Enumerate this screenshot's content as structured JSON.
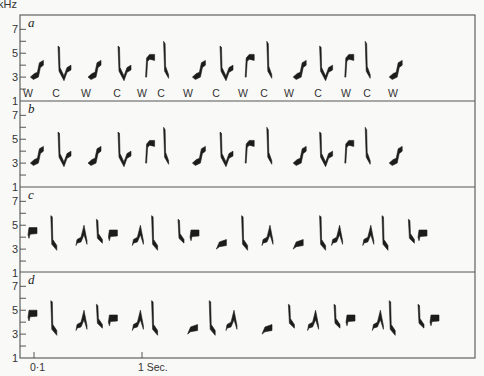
{
  "chart_data": {
    "type": "spectrogram",
    "title": "",
    "ylabel": "kHz",
    "xlabel": "",
    "y_ticks": [
      "1",
      "3",
      "5",
      "7"
    ],
    "ylim": [
      1,
      8
    ],
    "x_ticks": [
      {
        "label": "0·1",
        "t": 0.1
      },
      {
        "label": "1 Sec.",
        "t": 1.0
      }
    ],
    "xlim": [
      0,
      3.6
    ],
    "panels": [
      {
        "letter": "a",
        "note_labels": [
          "W",
          "C",
          "W",
          "C",
          "W",
          "C",
          "W",
          "C",
          "W",
          "C",
          "W",
          "C",
          "W",
          "C",
          "W"
        ],
        "syllables": [
          {
            "type": "W",
            "t": 0.07
          },
          {
            "type": "C",
            "t": 0.3
          },
          {
            "type": "W",
            "t": 0.55
          },
          {
            "type": "C",
            "t": 0.8
          },
          {
            "type": "Wf",
            "t": 1.03
          },
          {
            "type": "Cf",
            "t": 1.18
          },
          {
            "type": "W",
            "t": 1.42
          },
          {
            "type": "C",
            "t": 1.65
          },
          {
            "type": "Wf",
            "t": 1.86
          },
          {
            "type": "Cf",
            "t": 2.04
          },
          {
            "type": "W",
            "t": 2.26
          },
          {
            "type": "C",
            "t": 2.48
          },
          {
            "type": "Wf",
            "t": 2.69
          },
          {
            "type": "Cf",
            "t": 2.86
          },
          {
            "type": "W",
            "t": 3.06
          }
        ]
      },
      {
        "letter": "b",
        "note_labels": [],
        "syllables": [
          {
            "type": "W",
            "t": 0.07
          },
          {
            "type": "C",
            "t": 0.3
          },
          {
            "type": "W",
            "t": 0.55
          },
          {
            "type": "C",
            "t": 0.8
          },
          {
            "type": "Wf",
            "t": 1.03
          },
          {
            "type": "Cf",
            "t": 1.18
          },
          {
            "type": "W",
            "t": 1.42
          },
          {
            "type": "C",
            "t": 1.65
          },
          {
            "type": "Wf",
            "t": 1.86
          },
          {
            "type": "Cf",
            "t": 2.04
          },
          {
            "type": "W",
            "t": 2.26
          },
          {
            "type": "C",
            "t": 2.48
          },
          {
            "type": "Wf",
            "t": 2.69
          },
          {
            "type": "Cf",
            "t": 2.86
          },
          {
            "type": "W",
            "t": 3.06
          }
        ]
      },
      {
        "letter": "c",
        "note_labels": [],
        "syllables": [
          {
            "type": "Flat",
            "t": 0.05,
            "f": 4.5
          },
          {
            "type": "Drop",
            "t": 0.24
          },
          {
            "type": "Peak",
            "t": 0.45
          },
          {
            "type": "DropS",
            "t": 0.62
          },
          {
            "type": "Flat",
            "t": 0.72,
            "f": 4.3
          },
          {
            "type": "Peak",
            "t": 0.92
          },
          {
            "type": "Drop",
            "t": 1.08
          },
          {
            "type": "DropS",
            "t": 1.3
          },
          {
            "type": "Flat",
            "t": 1.4,
            "f": 4.3
          },
          {
            "type": "Rise",
            "t": 1.62
          },
          {
            "type": "Drop",
            "t": 1.83
          },
          {
            "type": "Peak",
            "t": 2.0
          },
          {
            "type": "Rise",
            "t": 2.26
          },
          {
            "type": "Drop",
            "t": 2.48
          },
          {
            "type": "Peak",
            "t": 2.58
          },
          {
            "type": "Peak",
            "t": 2.84
          },
          {
            "type": "Drop",
            "t": 3.0
          },
          {
            "type": "DropS",
            "t": 3.22
          },
          {
            "type": "Flat",
            "t": 3.3,
            "f": 4.3
          }
        ]
      },
      {
        "letter": "d",
        "note_labels": [],
        "syllables": [
          {
            "type": "Flat",
            "t": 0.05,
            "f": 4.7
          },
          {
            "type": "Drop",
            "t": 0.24
          },
          {
            "type": "Peak",
            "t": 0.45
          },
          {
            "type": "DropS",
            "t": 0.62
          },
          {
            "type": "Flat",
            "t": 0.72,
            "f": 4.3
          },
          {
            "type": "Peak",
            "t": 0.92
          },
          {
            "type": "Drop",
            "t": 1.08
          },
          {
            "type": "Rise",
            "t": 1.38
          },
          {
            "type": "Drop",
            "t": 1.56
          },
          {
            "type": "Peak",
            "t": 1.7
          },
          {
            "type": "Rise",
            "t": 2.0
          },
          {
            "type": "DropS",
            "t": 2.22
          },
          {
            "type": "Peak",
            "t": 2.38
          },
          {
            "type": "DropS",
            "t": 2.6
          },
          {
            "type": "Flat",
            "t": 2.7,
            "f": 4.3
          },
          {
            "type": "Peak",
            "t": 2.92
          },
          {
            "type": "Drop",
            "t": 3.06
          },
          {
            "type": "DropS",
            "t": 3.3
          },
          {
            "type": "Flat",
            "t": 3.4,
            "f": 4.3
          }
        ]
      }
    ]
  }
}
